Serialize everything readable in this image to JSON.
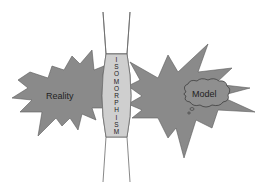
{
  "diagram": {
    "left_shape": {
      "label": "Reality",
      "shape": "explosion-star",
      "fill": "#8a8a8a",
      "stroke": "#555555"
    },
    "right_shape": {
      "label": "Model",
      "shape": "explosion-star",
      "fill": "#8a8a8a",
      "stroke": "#555555",
      "callout": {
        "shape": "thought-cloud",
        "label": "Model",
        "fill": "#8f8f8f",
        "stroke": "#333333"
      }
    },
    "bridge": {
      "label": "ISOMORPHISM",
      "letters": [
        "I",
        "S",
        "O",
        "M",
        "O",
        "R",
        "P",
        "H",
        "I",
        "S",
        "M"
      ],
      "fill": "#cfcfcf",
      "stroke": "#555555",
      "orientation": "vertical"
    }
  }
}
